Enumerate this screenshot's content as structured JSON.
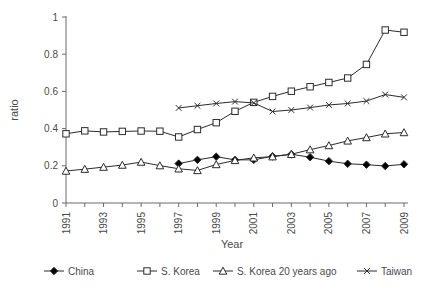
{
  "chart_data": {
    "type": "line",
    "title": "",
    "xlabel": "Year",
    "ylabel": "ratio",
    "xlim": [
      1991,
      2009
    ],
    "ylim": [
      0,
      1
    ],
    "yticks": [
      0,
      0.2,
      0.4,
      0.6,
      0.8,
      1
    ],
    "ytick_labels": [
      "0",
      "0.2",
      "0.4",
      "0.6",
      "0.8",
      "1"
    ],
    "xticks": [
      1991,
      1992,
      1993,
      1994,
      1995,
      1996,
      1997,
      1998,
      1999,
      2000,
      2001,
      2002,
      2003,
      2004,
      2005,
      2006,
      2007,
      2008,
      2009
    ],
    "xtick_labels": [
      "1991",
      "",
      "1993",
      "",
      "1995",
      "",
      "1997",
      "",
      "1999",
      "",
      "2001",
      "",
      "2003",
      "",
      "2005",
      "",
      "2007",
      "",
      "2009"
    ],
    "xtick_labels_rotated": true,
    "grid": false,
    "legend_position": "below",
    "series": [
      {
        "name": "China",
        "marker": "filled-diamond",
        "x": [
          1997,
          1998,
          1999,
          2000,
          2001,
          2002,
          2003,
          2004,
          2005,
          2006,
          2007,
          2008,
          2009
        ],
        "values": [
          0.212,
          0.232,
          0.249,
          0.232,
          0.232,
          0.251,
          0.262,
          0.246,
          0.225,
          0.211,
          0.206,
          0.199,
          0.208
        ]
      },
      {
        "name": "S. Korea",
        "marker": "open-square",
        "x": [
          1991,
          1992,
          1993,
          1994,
          1995,
          1996,
          1997,
          1998,
          1999,
          2000,
          2001,
          2002,
          2003,
          2004,
          2005,
          2006,
          2007,
          2008,
          2009
        ],
        "values": [
          0.372,
          0.388,
          0.382,
          0.385,
          0.387,
          0.386,
          0.355,
          0.395,
          0.432,
          0.493,
          0.541,
          0.573,
          0.601,
          0.625,
          0.648,
          0.672,
          0.745,
          0.93,
          0.918
        ]
      },
      {
        "name": "S. Korea 20 years ago",
        "marker": "open-triangle",
        "x": [
          1991,
          1992,
          1993,
          1994,
          1995,
          1996,
          1997,
          1998,
          1999,
          2000,
          2001,
          2002,
          2003,
          2004,
          2005,
          2006,
          2007,
          2008,
          2009
        ],
        "values": [
          0.172,
          0.182,
          0.193,
          0.204,
          0.22,
          0.201,
          0.184,
          0.175,
          0.207,
          0.229,
          0.243,
          0.249,
          0.262,
          0.287,
          0.309,
          0.334,
          0.352,
          0.372,
          0.379
        ]
      },
      {
        "name": "Taiwan",
        "marker": "cross",
        "x": [
          1997,
          1998,
          1999,
          2000,
          2001,
          2002,
          2003,
          2004,
          2005,
          2006,
          2007,
          2008,
          2009
        ],
        "values": [
          0.511,
          0.523,
          0.535,
          0.545,
          0.538,
          0.492,
          0.5,
          0.513,
          0.527,
          0.535,
          0.548,
          0.583,
          0.568
        ]
      }
    ]
  },
  "legend": {
    "items": [
      {
        "label": "China",
        "marker": "filled-diamond"
      },
      {
        "label": "S. Korea",
        "marker": "open-square"
      },
      {
        "label": "S. Korea 20 years ago",
        "marker": "open-triangle"
      },
      {
        "label": "Taiwan",
        "marker": "cross"
      }
    ]
  },
  "colors": {
    "line": "#2b2b2b",
    "axis": "#6b6b6b",
    "text": "#4a4a4a",
    "background": "#ffffff"
  }
}
